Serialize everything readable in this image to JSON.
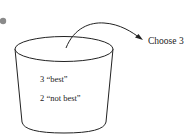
{
  "diagram": {
    "bullet_color": "#8a8a8a",
    "stroke_color": "#222222",
    "bucket": {
      "contents": [
        {
          "label": "3 “best”"
        },
        {
          "label": "2 “not best”"
        }
      ]
    },
    "arrow": {
      "label": "Choose 3"
    }
  }
}
